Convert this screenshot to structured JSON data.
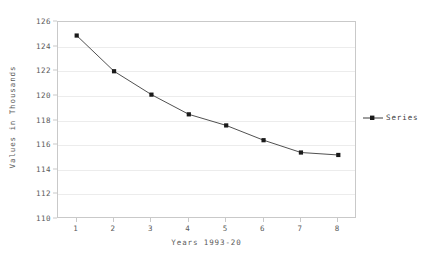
{
  "chart_data": {
    "type": "line",
    "title": "",
    "xlabel": "Years 1993-20",
    "ylabel": "Values in Thousands",
    "x": [
      1,
      2,
      3,
      4,
      5,
      6,
      7,
      8
    ],
    "categories": [
      "1",
      "2",
      "3",
      "4",
      "5",
      "6",
      "7",
      "8"
    ],
    "series": [
      {
        "name": "Series",
        "values": [
          124.9,
          122.0,
          120.1,
          118.5,
          117.6,
          116.4,
          115.4,
          115.2
        ],
        "color": "#3c3c3c",
        "marker": "square"
      }
    ],
    "ylim": [
      110,
      126
    ],
    "xlim": [
      0.5,
      8.5
    ],
    "yticks": [
      110,
      112,
      114,
      116,
      118,
      120,
      122,
      124,
      126
    ],
    "ytick_labels": [
      "110",
      "112",
      "114",
      "116",
      "118",
      "120",
      "122",
      "124",
      "126"
    ],
    "xticks": [
      1,
      2,
      3,
      4,
      5,
      6,
      7,
      8
    ],
    "xtick_labels": [
      "1",
      "2",
      "3",
      "4",
      "5",
      "6",
      "7",
      "8"
    ],
    "grid": "horizontal",
    "grid_color": "#ececec",
    "legend_position": "right",
    "frame_color": "#c9c9c9",
    "background": "#ffffff"
  },
  "legend": {
    "entries": [
      {
        "label": "Series",
        "color": "#3c3c3c"
      }
    ]
  },
  "axes": {
    "y_title": "Values in Thousands",
    "x_title": "Years 1993-20"
  }
}
